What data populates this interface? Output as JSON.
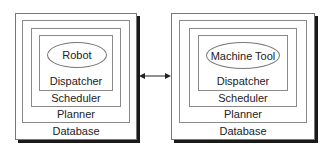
{
  "diagram": {
    "left_stack": {
      "core": "Robot",
      "layers": [
        "Dispatcher",
        "Scheduler",
        "Planner",
        "Database"
      ]
    },
    "right_stack": {
      "core": "Machine Tool",
      "layers": [
        "Dispatcher",
        "Scheduler",
        "Planner",
        "Database"
      ]
    },
    "connector": "bidirectional-arrow"
  }
}
